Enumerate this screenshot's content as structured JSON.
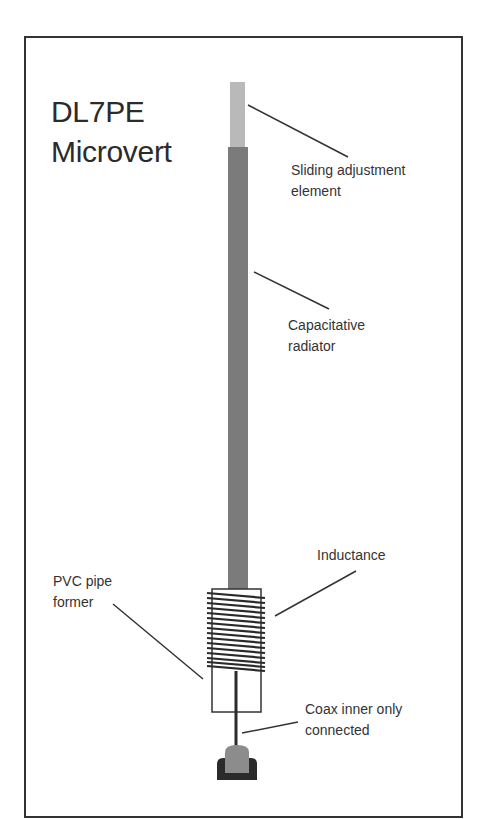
{
  "title": {
    "line1": "DL7PE",
    "line2": "Microvert"
  },
  "labels": {
    "sliding": {
      "line1": "Sliding adjustment",
      "line2": "element"
    },
    "capacitative": {
      "line1": "Capacitative",
      "line2": "radiator"
    },
    "inductance": {
      "line1": "Inductance"
    },
    "pvc": {
      "line1": "PVC pipe",
      "line2": "former"
    },
    "coax": {
      "line1": "Coax inner only",
      "line2": "connected"
    }
  },
  "colors": {
    "frame": "#333333",
    "sliding_element": "#b9b9b9",
    "radiator": "#7b7b7b",
    "coil": "#2a2a2a",
    "connector_body": "#8c8c8c",
    "connector_base": "#2b2b2b"
  },
  "coil": {
    "turns": 16
  }
}
